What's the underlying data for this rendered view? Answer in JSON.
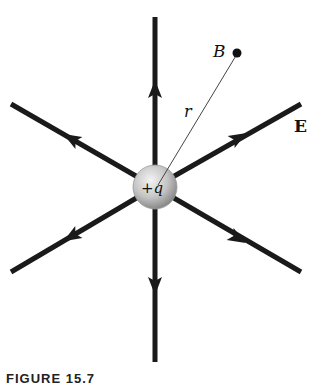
{
  "figure": {
    "charge_label": "+q",
    "point_label": "B",
    "distance_label": "r",
    "field_label": "E",
    "caption": "FIGURE 15.7"
  },
  "colors": {
    "field_line": "#1a1a1a",
    "charge_fill": "#c8c8c8",
    "background": "#ffffff"
  }
}
